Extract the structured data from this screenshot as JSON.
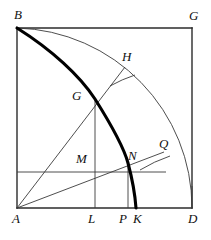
{
  "figure": {
    "background_color": "#ffffff",
    "ink_color": "#1a1a1a",
    "thin_stroke_color": "#333333",
    "thick_stroke_color": "#000000",
    "square": {
      "corners": {
        "A": {
          "x": 17,
          "y": 208
        },
        "B": {
          "x": 17,
          "y": 28
        },
        "G": {
          "x": 192,
          "y": 28
        },
        "D": {
          "x": 192,
          "y": 208
        }
      },
      "width": 175,
      "height": 180
    },
    "labels": [
      {
        "name": "point-label-B",
        "text": "B",
        "x": 14,
        "y": 8
      },
      {
        "name": "point-label-G",
        "text": "G",
        "x": 189,
        "y": 9
      },
      {
        "name": "point-label-H",
        "text": "H",
        "x": 122,
        "y": 50
      },
      {
        "name": "point-label-G-inner",
        "text": "G",
        "x": 72,
        "y": 89
      },
      {
        "name": "point-label-M",
        "text": "M",
        "x": 76,
        "y": 152
      },
      {
        "name": "point-label-N",
        "text": "N",
        "x": 128,
        "y": 149
      },
      {
        "name": "point-label-Q",
        "text": "Q",
        "x": 159,
        "y": 137
      },
      {
        "name": "point-label-A",
        "text": "A",
        "x": 12,
        "y": 212
      },
      {
        "name": "point-label-L",
        "text": "L",
        "x": 88,
        "y": 212
      },
      {
        "name": "point-label-P",
        "text": "P",
        "x": 119,
        "y": 212
      },
      {
        "name": "point-label-K",
        "text": "K",
        "x": 133,
        "y": 212
      },
      {
        "name": "point-label-D",
        "text": "D",
        "x": 188,
        "y": 212
      }
    ],
    "points": {
      "H": {
        "x": 125,
        "y": 67
      },
      "G_inner": {
        "x": 95,
        "y": 99
      },
      "M": {
        "x": 95,
        "y": 172
      },
      "N": {
        "x": 128,
        "y": 163
      },
      "Q": {
        "x": 164,
        "y": 152
      },
      "L": {
        "x": 95,
        "y": 208
      },
      "P": {
        "x": 128,
        "y": 208
      },
      "K": {
        "x": 137,
        "y": 208
      }
    },
    "arcs": [
      {
        "name": "quarter-arc-BD",
        "from": "B",
        "to": "D",
        "center": "A",
        "radius": 180,
        "weight": "thin"
      },
      {
        "name": "quadratrix-curve-BK",
        "from": "B",
        "to": "K",
        "weight": "thick"
      },
      {
        "name": "arc-segment-H",
        "note": "short radius tick at H",
        "weight": "thin"
      },
      {
        "name": "arc-segment-Q",
        "note": "short radius tick at Q",
        "weight": "thin"
      }
    ],
    "segments": [
      {
        "name": "radius-A-H",
        "from": "A",
        "to": "H"
      },
      {
        "name": "radius-A-Q",
        "from": "A",
        "to": "Q"
      },
      {
        "name": "ordinate-G-L",
        "from": "G_inner",
        "to": "L"
      },
      {
        "name": "ordinate-N-P",
        "from": "N",
        "to": "P"
      },
      {
        "name": "horizontal-through-M",
        "from": "left-edge",
        "to": "Q"
      }
    ]
  }
}
